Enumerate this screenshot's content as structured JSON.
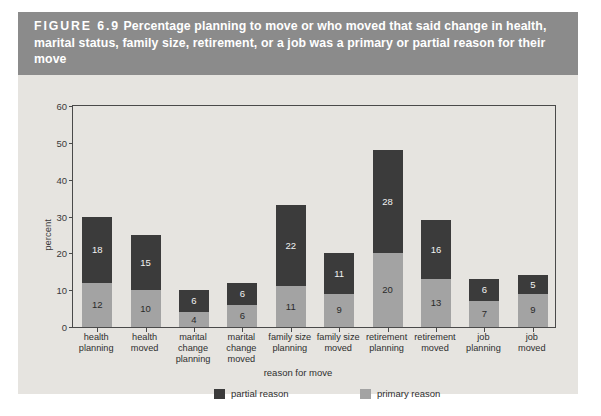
{
  "figure": {
    "number": "FIGURE  6.9",
    "caption": "Percentage planning to move or who moved that said change in health, marital status, family size, retirement, or a job was a primary or partial reason for their move",
    "caption_full": "FIGURE  6.9  Percentage planning to move or who moved that said change in health, marital status, family size, retirement, or a job was a primary or partial reason for their move"
  },
  "colors": {
    "header_bg": "#8b8b8b",
    "figure_bg": "#e6e4e0",
    "partial": "#3b3b3b",
    "primary": "#a3a3a3",
    "axis": "#4a4a4a"
  },
  "legend": {
    "position": "bottom",
    "items": [
      {
        "label": "partial reason",
        "color": "#3b3b3b"
      },
      {
        "label": "primary reason",
        "color": "#a3a3a3"
      }
    ]
  },
  "chart_data": {
    "type": "bar",
    "stacked": true,
    "title": "Percentage planning to move or who moved that said change in health, marital status, family size, retirement, or a job was a primary or partial reason for their move",
    "xlabel": "reason for move",
    "ylabel": "percent",
    "ylim": [
      0,
      60
    ],
    "yticks": [
      0,
      10,
      20,
      30,
      40,
      50,
      60
    ],
    "grid": false,
    "categories": [
      "health planning",
      "health moved",
      "marital change planning",
      "marital change moved",
      "family size planning",
      "family size moved",
      "retirement planning",
      "retirement moved",
      "job planning",
      "job moved"
    ],
    "category_lines": [
      [
        "health",
        "planning"
      ],
      [
        "health",
        "moved"
      ],
      [
        "marital",
        "change",
        "planning"
      ],
      [
        "marital",
        "change",
        "moved"
      ],
      [
        "family size",
        "planning"
      ],
      [
        "family size",
        "moved"
      ],
      [
        "retirement",
        "planning"
      ],
      [
        "retirement",
        "moved"
      ],
      [
        "job",
        "planning"
      ],
      [
        "job",
        "moved"
      ]
    ],
    "series": [
      {
        "name": "primary reason",
        "color": "#a3a3a3",
        "values": [
          12,
          10,
          4,
          6,
          11,
          9,
          20,
          13,
          7,
          9
        ]
      },
      {
        "name": "partial reason",
        "color": "#3b3b3b",
        "values": [
          18,
          15,
          6,
          6,
          22,
          11,
          28,
          16,
          6,
          5
        ]
      }
    ],
    "totals": [
      30,
      25,
      10,
      12,
      33,
      20,
      48,
      29,
      13,
      14
    ]
  }
}
